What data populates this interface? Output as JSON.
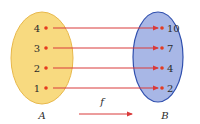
{
  "diagram": {
    "type": "function-mapping",
    "function_label": "f",
    "colors": {
      "set_a_fill": "#f8da80",
      "set_a_stroke": "#e8b84a",
      "set_b_fill": "#a8b7e6",
      "set_b_stroke": "#2f4fae",
      "arrow": "#d93a3a",
      "dot": "#e53b1f",
      "text": "#2b2b2b"
    },
    "set_a": {
      "label": "A",
      "elements": [
        "4",
        "3",
        "2",
        "1"
      ]
    },
    "set_b": {
      "label": "B",
      "elements": [
        "10",
        "7",
        "4",
        "2"
      ]
    },
    "mappings": [
      {
        "from": "4",
        "to": "10"
      },
      {
        "from": "3",
        "to": "7"
      },
      {
        "from": "2",
        "to": "4"
      },
      {
        "from": "1",
        "to": "2"
      }
    ]
  }
}
